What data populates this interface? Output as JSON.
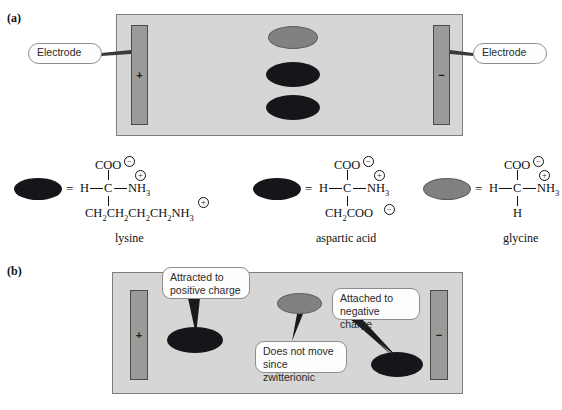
{
  "figure": {
    "panels": [
      {
        "id": "a",
        "label": "(a)"
      },
      {
        "id": "b",
        "label": "(b)"
      }
    ]
  },
  "panel_a": {
    "label": "(a)",
    "electrode_left": {
      "sign": "+",
      "callout": "Electrode"
    },
    "electrode_right": {
      "sign": "−",
      "callout": "Electrode"
    },
    "blobs": [
      {
        "name": "glycine",
        "color": "#818184",
        "state": "grey"
      },
      {
        "name": "lysine",
        "color": "#16161a",
        "state": "dark"
      },
      {
        "name": "aspartic acid",
        "color": "#16161a",
        "state": "dark"
      }
    ]
  },
  "panel_b": {
    "label": "(b)",
    "electrode_left": {
      "sign": "+"
    },
    "electrode_right": {
      "sign": "−"
    },
    "callouts": [
      {
        "id": "attracted",
        "line1": "Attracted to",
        "line2": "positive charge"
      },
      {
        "id": "attached",
        "line1": "Attached to",
        "line2": "negative charge"
      },
      {
        "id": "nomove",
        "line1": "Does not move",
        "line2": "since zwitterionic"
      }
    ]
  },
  "structures": [
    {
      "name": "lysine",
      "blob_color": "dark",
      "equals": "=",
      "top_group": "COO",
      "top_charge": "−",
      "left_atom": "H",
      "center_atom": "C",
      "right_group": "NH",
      "right_sub": "3",
      "right_charge": "+",
      "bottom_group": "CH",
      "bottom_text": "CH2CH2CH2CH2NH3",
      "bottom_charge": "+"
    },
    {
      "name": "aspartic acid",
      "blob_color": "dark",
      "equals": "=",
      "top_group": "COO",
      "top_charge": "−",
      "left_atom": "H",
      "center_atom": "C",
      "right_group": "NH",
      "right_sub": "3",
      "right_charge": "+",
      "bottom_text": "CH2COO",
      "bottom_charge": "−"
    },
    {
      "name": "glycine",
      "blob_color": "grey",
      "equals": "=",
      "top_group": "COO",
      "top_charge": "−",
      "left_atom": "H",
      "center_atom": "C",
      "right_group": "NH",
      "right_sub": "3",
      "right_charge": "+",
      "bottom_text": "H",
      "bottom_charge": ""
    }
  ],
  "colors": {
    "cell_fill": "#d6d6d4",
    "cell_border": "#7e7e7c",
    "electrode_fill": "#9a9a98",
    "blob_dark": "#16161a",
    "blob_grey": "#818184",
    "bubble_fill": "#fdfdfd",
    "bubble_border": "#8d8d8d"
  }
}
